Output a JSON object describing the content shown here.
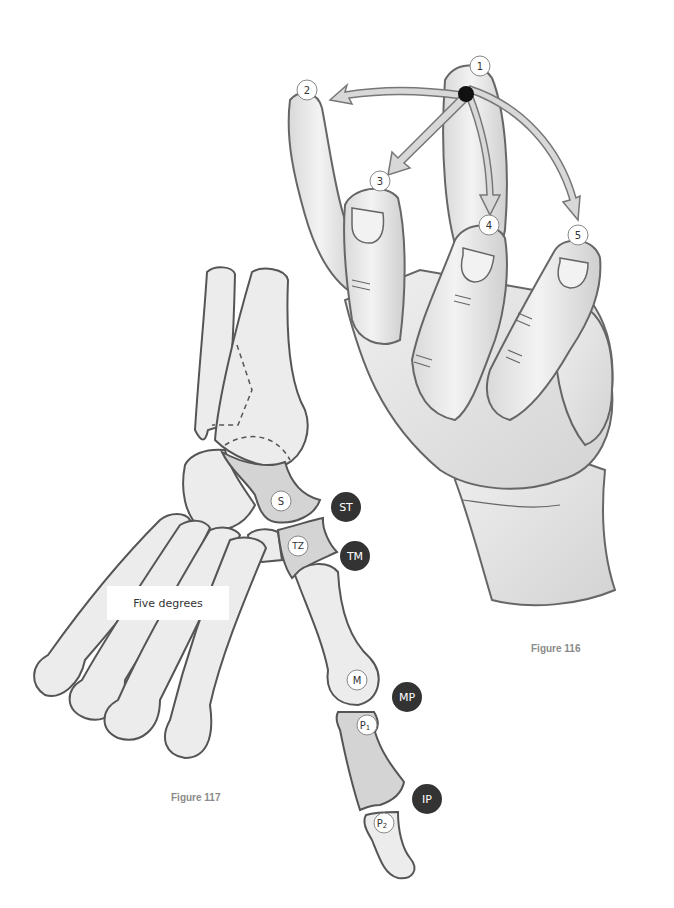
{
  "figures": {
    "hand": {
      "caption": "Figure 116",
      "markers": [
        {
          "id": "1",
          "label": "1"
        },
        {
          "id": "2",
          "label": "2"
        },
        {
          "id": "3",
          "label": "3"
        },
        {
          "id": "4",
          "label": "4"
        },
        {
          "id": "5",
          "label": "5"
        }
      ]
    },
    "wrist_bones": {
      "caption": "Figure 117",
      "annotation": "Five degrees",
      "bone_labels": {
        "scaphoid": "S",
        "trapezium": "TZ",
        "metacarpal": "M",
        "proximal_phalanx": "P",
        "proximal_phalanx_sub": "1",
        "distal_phalanx": "P",
        "distal_phalanx_sub": "2"
      },
      "joint_labels": {
        "st": "ST",
        "tm": "TM",
        "mp": "MP",
        "ip": "IP"
      }
    }
  },
  "colors": {
    "outline": "#555555",
    "bone_fill": "#ececec",
    "highlight_fill": "#d4d4d4",
    "skin_fill": "#e6e6e6",
    "arrow_fill": "#d8d8d8",
    "joint_badge": "#333333",
    "caption": "#8a8a8a"
  }
}
